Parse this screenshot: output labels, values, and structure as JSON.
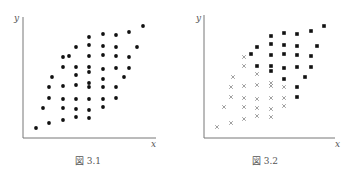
{
  "figures": [
    {
      "caption": "図 3.1",
      "xlabel": "x",
      "ylabel": "y",
      "axis": {
        "x0": 23,
        "y0": 138,
        "xend": 156,
        "ytop": 17
      },
      "caption_pos": [
        88,
        154
      ],
      "xlabel_pos": [
        151,
        139
      ],
      "ylabel_pos": [
        14,
        13
      ],
      "dots": [
        [
          36,
          128
        ],
        [
          49,
          123
        ],
        [
          63,
          120
        ],
        [
          76,
          117
        ],
        [
          89,
          118
        ],
        [
          43,
          108
        ],
        [
          63,
          108
        ],
        [
          76,
          109
        ],
        [
          89,
          110
        ],
        [
          103,
          107
        ],
        [
          49,
          98
        ],
        [
          63,
          99
        ],
        [
          76,
          99
        ],
        [
          89,
          99
        ],
        [
          103,
          99
        ],
        [
          116,
          98
        ],
        [
          49,
          87
        ],
        [
          63,
          86
        ],
        [
          76,
          85
        ],
        [
          89,
          83
        ],
        [
          89,
          87
        ],
        [
          103,
          87
        ],
        [
          116,
          87
        ],
        [
          52,
          77
        ],
        [
          76,
          75
        ],
        [
          89,
          72
        ],
        [
          103,
          79
        ],
        [
          124,
          77
        ],
        [
          63,
          67
        ],
        [
          76,
          67
        ],
        [
          89,
          67
        ],
        [
          103,
          69
        ],
        [
          116,
          68
        ],
        [
          129,
          68
        ],
        [
          63,
          57
        ],
        [
          69,
          56
        ],
        [
          89,
          56
        ],
        [
          103,
          55
        ],
        [
          116,
          56
        ],
        [
          129,
          57
        ],
        [
          76,
          47
        ],
        [
          89,
          45
        ],
        [
          103,
          46
        ],
        [
          116,
          47
        ],
        [
          137,
          47
        ],
        [
          89,
          37
        ],
        [
          103,
          34
        ],
        [
          116,
          35
        ],
        [
          129,
          32
        ],
        [
          143,
          26
        ]
      ]
    },
    {
      "caption": "図 3.2",
      "xlabel": "x",
      "ylabel": "y",
      "axis": {
        "x0": 204,
        "y0": 138,
        "xend": 335,
        "ytop": 15
      },
      "caption_pos": [
        265,
        154
      ],
      "xlabel_pos": [
        335,
        139
      ],
      "ylabel_pos": [
        196,
        13
      ],
      "squares": [
        [
          324,
          26
        ],
        [
          311,
          31
        ],
        [
          297,
          34
        ],
        [
          284,
          33
        ],
        [
          271,
          36
        ],
        [
          257,
          47
        ],
        [
          271,
          44
        ],
        [
          284,
          45
        ],
        [
          297,
          46
        ],
        [
          317,
          46
        ],
        [
          251,
          54
        ],
        [
          271,
          55
        ],
        [
          284,
          54
        ],
        [
          297,
          55
        ],
        [
          311,
          56
        ],
        [
          257,
          66
        ],
        [
          271,
          66
        ],
        [
          271,
          71
        ],
        [
          284,
          68
        ],
        [
          297,
          67
        ],
        [
          311,
          67
        ],
        [
          305,
          77
        ],
        [
          284,
          79
        ],
        [
          297,
          87
        ],
        [
          297,
          97
        ]
      ],
      "crosses": [
        [
          244,
          57
        ],
        [
          244,
          66
        ],
        [
          257,
          74
        ],
        [
          233,
          77
        ],
        [
          231,
          87
        ],
        [
          244,
          86
        ],
        [
          257,
          85
        ],
        [
          271,
          83
        ],
        [
          271,
          86
        ],
        [
          284,
          87
        ],
        [
          231,
          97
        ],
        [
          244,
          98
        ],
        [
          257,
          99
        ],
        [
          271,
          98
        ],
        [
          284,
          98
        ],
        [
          224,
          107
        ],
        [
          244,
          107
        ],
        [
          257,
          108
        ],
        [
          271,
          109
        ],
        [
          284,
          106
        ],
        [
          257,
          116
        ],
        [
          271,
          117
        ],
        [
          244,
          119
        ],
        [
          231,
          123
        ],
        [
          217,
          127
        ]
      ]
    }
  ],
  "colors": {
    "axis": "#777777",
    "marker": "#111111",
    "cross": "#888888"
  }
}
